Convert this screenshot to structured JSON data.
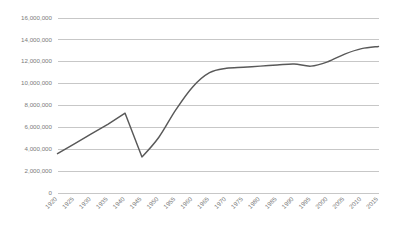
{
  "chart_data": {
    "type": "line",
    "title": "",
    "subtitle": "",
    "xlabel": "",
    "ylabel": "",
    "grid": true,
    "legend": false,
    "legend_position": "none",
    "line_color": "#595959",
    "gridline_color": "#b9b9b9",
    "tick_label_color": "#7b7b7b",
    "x_tick_rotation_deg": -45,
    "xlim": [
      1920,
      2015
    ],
    "ylim": [
      0,
      16000000
    ],
    "y_tick_step": 2000000,
    "categories": [
      "1920",
      "1925",
      "1930",
      "1935",
      "1940",
      "1945",
      "1950",
      "1955",
      "1960",
      "1965",
      "1970",
      "1975",
      "1980",
      "1985",
      "1990",
      "1995",
      "2000",
      "2005",
      "2010",
      "2015"
    ],
    "x": [
      1920,
      1925,
      1930,
      1935,
      1940,
      1945,
      1950,
      1955,
      1960,
      1965,
      1970,
      1975,
      1980,
      1985,
      1990,
      1995,
      2000,
      2005,
      2010,
      2015
    ],
    "values": [
      3600000,
      4500000,
      5400000,
      6300000,
      7300000,
      3300000,
      5100000,
      7600000,
      9700000,
      11000000,
      11400000,
      11500000,
      11600000,
      11700000,
      11800000,
      11600000,
      12000000,
      12700000,
      13200000,
      13400000
    ],
    "ytick_labels": [
      "0",
      "2,000,000",
      "4,000,000",
      "6,000,000",
      "8,000,000",
      "10,000,000",
      "12,000,000",
      "14,000,000",
      "16,000,000"
    ],
    "ytick_values": [
      0,
      2000000,
      4000000,
      6000000,
      8000000,
      10000000,
      12000000,
      14000000,
      16000000
    ]
  }
}
